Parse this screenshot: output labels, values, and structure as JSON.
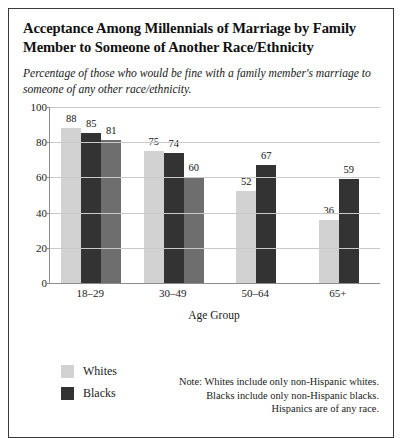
{
  "figure": {
    "title": "Acceptance Among Millennials of Marriage by Family Member to Someone of Another Race/Ethnicity",
    "subtitle": "Percentage of those who would be fine with a family member's marriage to someone of any other race/ethnicity."
  },
  "legend": {
    "items": [
      {
        "label": "Whites",
        "color": "#d2d2d2"
      },
      {
        "label": "Blacks",
        "color": "#333333"
      }
    ]
  },
  "note": {
    "lines": [
      "Note: Whites include only non-Hispanic whites.",
      "Blacks include only non-Hispanic blacks.",
      "Hispanics are of any race."
    ]
  },
  "chart_data": {
    "type": "bar",
    "title": "Acceptance Among Millennials of Marriage by Family Member to Someone of Another Race/Ethnicity",
    "subtitle": "Percentage of those who would be fine with a family member's marriage to someone of any other race/ethnicity.",
    "xlabel": "Age Group",
    "ylabel": "",
    "ylim": [
      0,
      100
    ],
    "yticks": [
      0,
      20,
      40,
      60,
      80,
      100
    ],
    "grid": true,
    "legend_position": "bottom-left",
    "categories": [
      "18–29",
      "30–49",
      "50–64",
      "65+"
    ],
    "series": [
      {
        "name": "Whites",
        "color": "#d2d2d2",
        "values": [
          88,
          75,
          52,
          36
        ]
      },
      {
        "name": "Blacks",
        "color": "#333333",
        "values": [
          85,
          74,
          67,
          59
        ]
      },
      {
        "name": "Hispanics",
        "color": "#6e6e6e",
        "values": [
          81,
          60,
          null,
          null
        ]
      }
    ]
  }
}
